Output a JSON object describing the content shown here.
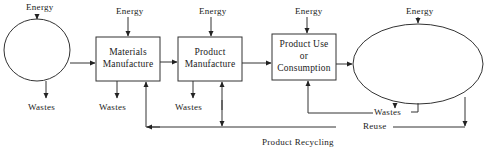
{
  "diagram": {
    "type": "life-cycle-flow",
    "nodes": [
      {
        "id": "raw-materials",
        "shape": "ellipse",
        "label": ""
      },
      {
        "id": "materials-manufacture",
        "shape": "box",
        "lines": [
          "Materials",
          "Manufacture"
        ]
      },
      {
        "id": "product-manufacture",
        "shape": "box",
        "lines": [
          "Product",
          "Manufacture"
        ]
      },
      {
        "id": "product-use",
        "shape": "box",
        "lines": [
          "Product Use",
          "or",
          "Consumption"
        ]
      },
      {
        "id": "disposal",
        "shape": "ellipse",
        "label": ""
      }
    ],
    "inputs": {
      "energy_label": "Energy"
    },
    "outputs": {
      "wastes_label": "Wastes"
    },
    "loops": {
      "reuse_label": "Reuse",
      "recycling_label": "Product Recycling"
    },
    "energy_labels": [
      "Energy",
      "Energy",
      "Energy",
      "Energy",
      "Energy"
    ],
    "wastes_labels": [
      "Wastes",
      "Wastes",
      "Wastes",
      "Wastes"
    ]
  }
}
